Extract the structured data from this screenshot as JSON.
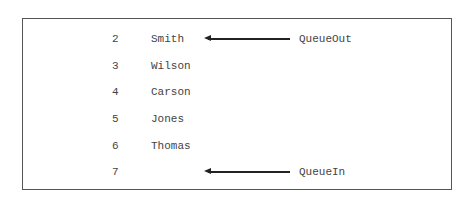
{
  "diagram": {
    "type": "queue-array",
    "rows": [
      {
        "index": "2",
        "value": "Smith"
      },
      {
        "index": "3",
        "value": "Wilson"
      },
      {
        "index": "4",
        "value": "Carson"
      },
      {
        "index": "5",
        "value": "Jones"
      },
      {
        "index": "6",
        "value": "Thomas"
      },
      {
        "index": "7",
        "value": ""
      }
    ],
    "pointers": {
      "out": {
        "label": "QueueOut",
        "row_index": "2"
      },
      "in": {
        "label": "QueueIn",
        "row_index": "7"
      }
    },
    "colors": {
      "border": "#555555",
      "text": "#444444",
      "arrow": "#222222"
    }
  }
}
